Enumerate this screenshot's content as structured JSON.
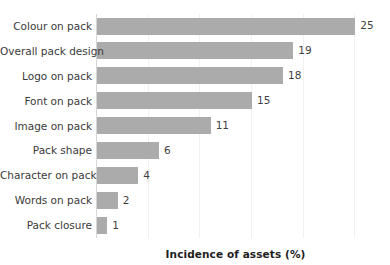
{
  "chart_data": {
    "type": "bar",
    "orientation": "horizontal",
    "title": "",
    "xlabel": "Incidence of assets (%)",
    "ylabel": "",
    "xlim": [
      0,
      27
    ],
    "grid": "vertical",
    "legend": "none",
    "bar_color": "#ababab",
    "categories": [
      "Colour on pack",
      "Overall pack design",
      "Logo on pack",
      "Font on pack",
      "Image on pack",
      "Pack shape",
      "Character on pack",
      "Words on pack",
      "Pack closure"
    ],
    "values": [
      25,
      19,
      18,
      15,
      11,
      6,
      4,
      2,
      1
    ],
    "value_labels": [
      "25",
      "19",
      "18",
      "15",
      "11",
      "6",
      "4",
      "2",
      "1"
    ],
    "gridline_values": [
      5,
      10,
      15,
      20,
      25
    ]
  }
}
